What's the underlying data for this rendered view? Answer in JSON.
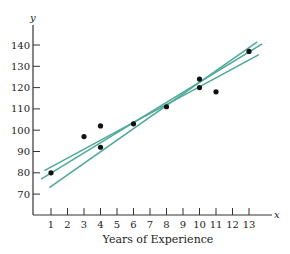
{
  "chart_data": {
    "type": "scatter",
    "title": "",
    "xlabel": "Years of Experience",
    "ylabel": "",
    "x_axis_name": "x",
    "y_axis_name": "y",
    "x_ticks": [
      1,
      2,
      3,
      4,
      5,
      6,
      7,
      8,
      9,
      10,
      11,
      12,
      13
    ],
    "y_ticks": [
      70,
      80,
      90,
      100,
      110,
      120,
      130,
      140
    ],
    "xlim": [
      0,
      14.3
    ],
    "ylim": [
      62,
      150
    ],
    "grid": false,
    "legend": null,
    "series": [
      {
        "name": "data points",
        "type": "scatter",
        "color": "#111111",
        "points": [
          {
            "x": 1,
            "y": 80
          },
          {
            "x": 3,
            "y": 97
          },
          {
            "x": 4,
            "y": 102
          },
          {
            "x": 4,
            "y": 92
          },
          {
            "x": 6,
            "y": 103
          },
          {
            "x": 8,
            "y": 111
          },
          {
            "x": 10,
            "y": 124
          },
          {
            "x": 10,
            "y": 120
          },
          {
            "x": 11,
            "y": 118
          },
          {
            "x": 13,
            "y": 137
          }
        ]
      }
    ],
    "lines": [
      {
        "name": "fit line 1",
        "color": "#4fa99a",
        "x1": 0.6,
        "y1": 81,
        "x2": 13.6,
        "y2": 135.5
      },
      {
        "name": "fit line 2",
        "color": "#4fa99a",
        "x1": 0.4,
        "y1": 77,
        "x2": 13.8,
        "y2": 140.5
      },
      {
        "name": "fit line 3",
        "color": "#4fa99a",
        "x1": 0.9,
        "y1": 73,
        "x2": 13.5,
        "y2": 141.5
      }
    ]
  }
}
